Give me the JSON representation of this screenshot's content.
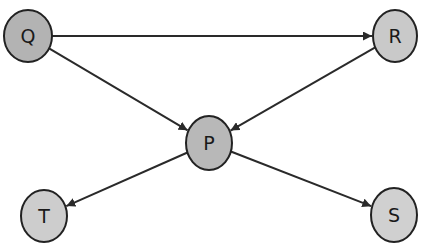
{
  "diagram": {
    "type": "directed-graph",
    "colors": {
      "edge": "#2a2a2a",
      "node_stroke": "#222222",
      "node_fill_dark": "#b3b3b3",
      "node_fill_light": "#cbcbcb",
      "background": "#ffffff"
    },
    "nodes": [
      {
        "id": "Q",
        "label": "Q",
        "x": 28,
        "y": 36,
        "rx": 24,
        "ry": 26,
        "fill": "#b3b3b3"
      },
      {
        "id": "R",
        "label": "R",
        "x": 395,
        "y": 36,
        "rx": 22,
        "ry": 26,
        "fill": "#c9c9c9"
      },
      {
        "id": "P",
        "label": "P",
        "x": 209,
        "y": 143,
        "rx": 23,
        "ry": 27,
        "fill": "#b8b8b8"
      },
      {
        "id": "T",
        "label": "T",
        "x": 44,
        "y": 216,
        "rx": 23,
        "ry": 26,
        "fill": "#cdcdcd"
      },
      {
        "id": "S",
        "label": "S",
        "x": 394,
        "y": 215,
        "rx": 23,
        "ry": 27,
        "fill": "#d0d0d0"
      }
    ],
    "edges": [
      {
        "from": "Q",
        "to": "R"
      },
      {
        "from": "Q",
        "to": "P"
      },
      {
        "from": "R",
        "to": "P"
      },
      {
        "from": "P",
        "to": "T"
      },
      {
        "from": "P",
        "to": "S"
      }
    ]
  }
}
